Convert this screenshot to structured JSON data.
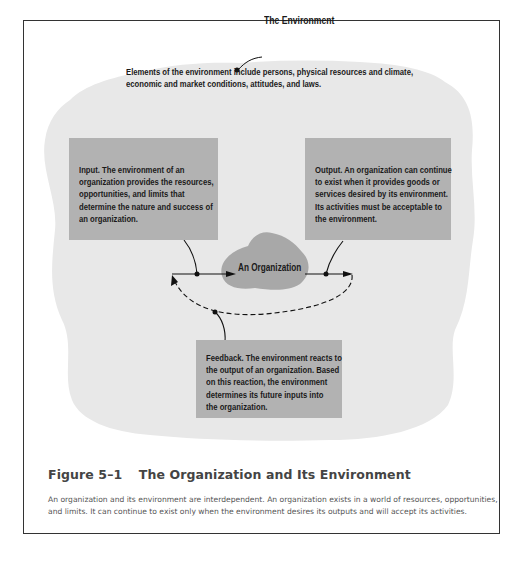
{
  "diagram": {
    "environment_label": "The Environment",
    "environment_description": [
      "Elements of the environment include persons, physical resources and climate,",
      "economic and market conditions, attitudes, and laws."
    ],
    "input_box": [
      "Input. The environment of an",
      "organization provides the resources,",
      "opportunities, and limits that",
      "determine the nature and success of",
      "an organization."
    ],
    "output_box": [
      "Output. An organization can continue",
      "to exist when it provides goods or",
      "services desired by its environment.",
      "Its activities must be acceptable to",
      "the environment."
    ],
    "organization_label": "An Organization",
    "feedback_box": [
      "Feedback. The environment reacts to",
      "the output of an organization.  Based",
      "on this reaction, the environment",
      "determines its future inputs into",
      "the organization."
    ],
    "colors": {
      "environment_fill": "#e8e8e8",
      "box_fill": "#b2b2b2",
      "organization_fill": "#a8a8a8",
      "frame_border": "#333333"
    }
  },
  "figure": {
    "number": "Figure 5–1",
    "title": "The Organization and Its Environment",
    "caption": [
      "An organization and its environment are interdependent. An organization exists in a world of resources, opportunities,",
      "and limits.  It can continue to exist only when the environment desires its outputs and will accept its activities."
    ]
  }
}
